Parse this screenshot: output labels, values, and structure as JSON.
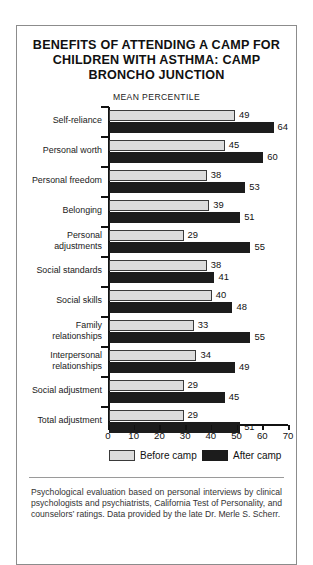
{
  "figure": {
    "title_lines": [
      "BENEFITS OF ATTENDING A CAMP FOR",
      "CHILDREN WITH ASTHMA: CAMP",
      "BRONCHO JUNCTION"
    ],
    "footnote": "Psychological evaluation based on personal interviews by clinical psychologists and psychiatrists, California Test of Personality, and counselors’ ratings. Data provided by the late Dr. Merle S. Scherr."
  },
  "chart_data": {
    "type": "bar",
    "orientation": "horizontal",
    "title": "BENEFITS OF ATTENDING A CAMP FOR CHILDREN WITH ASTHMA: CAMP BRONCHO JUNCTION",
    "subtitle": "MEAN PERCENTILE",
    "xlabel": "",
    "ylabel": "",
    "xlim": [
      0,
      70
    ],
    "xticks": [
      0,
      10,
      20,
      30,
      40,
      50,
      60,
      70
    ],
    "grid": false,
    "legend_position": "bottom",
    "categories": [
      "Self-reliance",
      "Personal worth",
      "Personal freedom",
      "Belonging",
      "Personal adjustments",
      "Social standards",
      "Social skills",
      "Family relationships",
      "Interpersonal relationships",
      "Social adjustment",
      "Total adjustment"
    ],
    "category_label_lines": [
      [
        "Self-reliance"
      ],
      [
        "Personal worth"
      ],
      [
        "Personal freedom"
      ],
      [
        "Belonging"
      ],
      [
        "Personal",
        "adjustments"
      ],
      [
        "Social standards"
      ],
      [
        "Social skills"
      ],
      [
        "Family",
        "relationships"
      ],
      [
        "Interpersonal",
        "relationships"
      ],
      [
        "Social adjustment"
      ],
      [
        "Total adjustment"
      ]
    ],
    "series": [
      {
        "name": "Before camp",
        "color": "#dcdcdc",
        "values": [
          49,
          45,
          38,
          39,
          29,
          38,
          40,
          33,
          34,
          29,
          29
        ]
      },
      {
        "name": "After camp",
        "color": "#1c1c1c",
        "values": [
          64,
          60,
          53,
          51,
          55,
          41,
          48,
          55,
          49,
          45,
          51
        ]
      }
    ]
  }
}
